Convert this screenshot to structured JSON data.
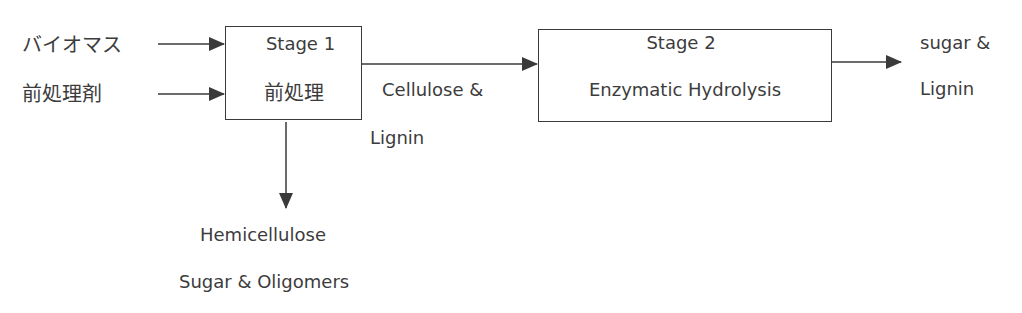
{
  "diagram": {
    "inputs": [
      {
        "label": "バイオマス"
      },
      {
        "label": "前処理剤"
      }
    ],
    "stages": [
      {
        "title": "Stage  1",
        "subtitle": "前処理"
      },
      {
        "title": "Stage  2",
        "subtitle": "Enzymatic Hydrolysis"
      }
    ],
    "intermediate": {
      "line1": "Cellulose &",
      "line2": "Lignin"
    },
    "byproduct": {
      "line1": "Hemicellulose",
      "line2": "Sugar & Oligomers"
    },
    "output": {
      "line1": "sugar &",
      "line2": "Lignin"
    },
    "colors": {
      "line": "#3a3a3a",
      "text": "#3c3c3c",
      "background": "#ffffff"
    }
  }
}
